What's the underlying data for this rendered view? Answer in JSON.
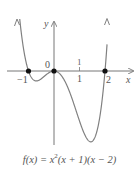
{
  "chart_data": {
    "type": "line",
    "xlabel": "x",
    "ylabel": "y",
    "function": "x^2*(x+1)*(x-2)",
    "x_ticks": [
      "-1",
      "0",
      "1",
      "2"
    ],
    "tick_labels_shown": {
      "neg1": "−1",
      "zero": "0",
      "one": "1",
      "two": "2"
    },
    "zeros": [
      -1,
      0,
      2
    ],
    "marked_points": [
      {
        "x": -1,
        "y": 0
      },
      {
        "x": 0,
        "y": 0
      },
      {
        "x": 2,
        "y": 0
      }
    ],
    "series": [
      {
        "name": "f(x)",
        "x": [
          -1.28,
          -1.0,
          -0.69,
          -0.3,
          0.0,
          0.5,
          1.0,
          1.44,
          1.8,
          2.0,
          2.1
        ],
        "values": [
          2.0,
          0.0,
          -0.4,
          -0.2,
          0.0,
          -0.56,
          -2.0,
          -2.83,
          -1.82,
          0.0,
          2.0
        ]
      }
    ],
    "xlim": [
      -1.85,
      3.05
    ],
    "ylim": [
      -3.0,
      2.0
    ],
    "grid": false,
    "legend": null
  },
  "labels": {
    "y_axis": "y",
    "x_axis": "x",
    "tick_neg1": "−1",
    "tick_zero": "0",
    "tick_one_above": "1",
    "tick_one_below": "1",
    "tick_two": "2",
    "caption_prefix": "f(x) = x",
    "caption_exp": "2",
    "caption_suffix": "(x + 1)(x − 2)"
  },
  "colors": {
    "axis": "#777777",
    "curve": "#808080",
    "point": "#111111",
    "text": "#555555"
  }
}
